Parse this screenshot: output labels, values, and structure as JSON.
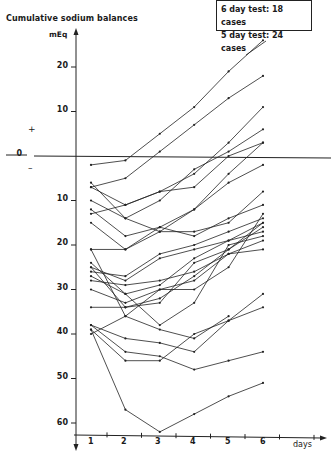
{
  "chart_data": {
    "type": "line",
    "title": "Cumulative sodium balances",
    "ylabel": "mEq",
    "xlabel": "days",
    "legend_box": [
      "6 day test: 18 cases",
      "5 day test: 24 cases"
    ],
    "x": [
      1,
      2,
      3,
      4,
      5,
      6
    ],
    "x_tick_labels": [
      "1",
      "2",
      "3",
      "4",
      "5",
      "6"
    ],
    "y_tick_labels_positive": [
      "20",
      "10"
    ],
    "y_tick_labels_negative": [
      "10",
      "20",
      "30",
      "40",
      "50",
      "60"
    ],
    "zero_label": "0",
    "sign_labels": {
      "plus": "+",
      "minus": "–"
    },
    "ylim": [
      -63,
      27
    ],
    "grid": false,
    "series": [
      {
        "name": "case-1",
        "values": [
          -2,
          -1,
          5,
          11,
          19,
          26
        ]
      },
      {
        "name": "case-2",
        "values": [
          -7,
          -5,
          1,
          7,
          13,
          18
        ]
      },
      {
        "name": "case-3",
        "values": [
          -13,
          -11,
          -8,
          -4,
          3,
          11
        ]
      },
      {
        "name": "case-4",
        "values": [
          -10,
          -14,
          -10,
          -3,
          1,
          6
        ]
      },
      {
        "name": "case-5",
        "values": [
          -7,
          -11,
          -8,
          -7,
          0,
          3
        ]
      },
      {
        "name": "case-6",
        "values": [
          -12,
          -18,
          -16,
          -12,
          -4,
          3
        ]
      },
      {
        "name": "case-7",
        "values": [
          -15,
          -21,
          -17,
          -12,
          -6,
          -2
        ]
      },
      {
        "name": "case-8",
        "values": [
          -6,
          -14,
          -17,
          -17,
          -15,
          -8
        ]
      },
      {
        "name": "case-9",
        "values": [
          -21,
          -21,
          -16,
          -18,
          -14,
          -11
        ]
      },
      {
        "name": "case-10",
        "values": [
          -25,
          -28,
          -23,
          -21,
          -19,
          -15
        ]
      },
      {
        "name": "case-11",
        "values": [
          -26,
          -27,
          -22,
          -20,
          -17,
          -14
        ]
      },
      {
        "name": "case-12",
        "values": [
          -27,
          -31,
          -29,
          -23,
          -19,
          -17
        ]
      },
      {
        "name": "case-13",
        "values": [
          -28,
          -29,
          -28,
          -26,
          -22,
          -19
        ]
      },
      {
        "name": "case-14",
        "values": [
          -30,
          -33,
          -30,
          -28,
          -22,
          -21
        ]
      },
      {
        "name": "case-15",
        "values": [
          -21,
          -36,
          -30,
          -30,
          -25,
          -13
        ]
      },
      {
        "name": "case-16",
        "values": [
          -34,
          -34,
          -33,
          -24,
          -21,
          -16
        ]
      },
      {
        "name": "case-17",
        "values": [
          -24,
          -31,
          -38,
          -33,
          -20,
          -18
        ]
      },
      {
        "name": "case-18",
        "values": [
          -25,
          -34,
          -32,
          -27,
          -21,
          -15
        ]
      },
      {
        "name": "case-19",
        "values": [
          -38,
          -41,
          -42,
          -44,
          -37,
          -31
        ]
      },
      {
        "name": "case-20",
        "values": [
          -39,
          -46,
          -46,
          -40,
          -37,
          -34
        ]
      },
      {
        "name": "case-21",
        "values": [
          -38,
          -44,
          -45,
          -48,
          -46,
          -44
        ]
      },
      {
        "name": "case-22",
        "values": [
          -40,
          -36,
          -39,
          -41,
          -36,
          null
        ]
      },
      {
        "name": "case-23",
        "values": [
          -39,
          -57,
          -62,
          -58,
          -54,
          -51
        ]
      }
    ]
  }
}
